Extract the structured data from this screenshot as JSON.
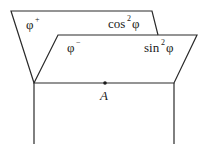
{
  "diagram": {
    "type": "half-planes-bundle",
    "planes": [
      {
        "id": "back",
        "label_left": {
          "base": "φ",
          "sup": "+"
        },
        "label_right": {
          "base": "cos",
          "sup": "2",
          "tail": "φ"
        }
      },
      {
        "id": "front",
        "label_left": {
          "base": "φ",
          "sup": "−"
        },
        "label_right": {
          "base": "sin",
          "sup": "2",
          "tail": "φ"
        }
      }
    ],
    "point": {
      "label": "A"
    }
  }
}
